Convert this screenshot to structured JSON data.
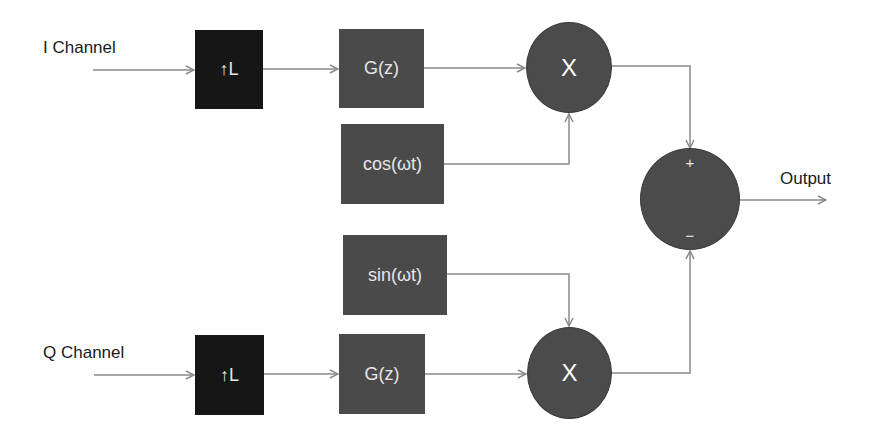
{
  "diagram": {
    "type": "IQ modulator block diagram",
    "inputs": {
      "i_channel": "I Channel",
      "q_channel": "Q Channel"
    },
    "output_label": "Output",
    "blocks": {
      "i_upsample": "↑L",
      "q_upsample": "↑L",
      "i_filter": "G(z)",
      "q_filter": "G(z)",
      "cos_osc": "cos(ωt)",
      "sin_osc": "sin(ωt)"
    },
    "multipliers": {
      "i_mult": "X",
      "q_mult": "X"
    },
    "summer": {
      "plus": "+",
      "minus": "−"
    },
    "colors": {
      "upsample_fill": "#161616",
      "block_fill": "#4a4a4a",
      "circle_fill": "#4b4b4b",
      "wire": "#8a8a8a",
      "text_dark": "#1a1a1a",
      "text_light": "#e6e6e6"
    }
  }
}
